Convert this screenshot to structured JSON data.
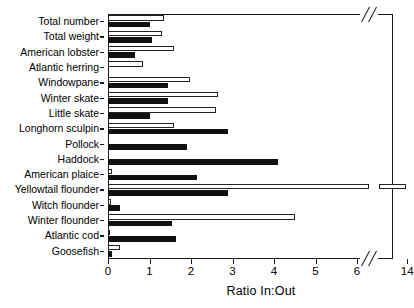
{
  "chart_data": {
    "type": "bar",
    "orientation": "horizontal",
    "title": "",
    "xlabel": "Ratio In:Out",
    "ylabel": "",
    "xlim": [
      0,
      14.6
    ],
    "grid": false,
    "legend": "none",
    "axis_break": {
      "from": 6.3,
      "to": 13.2,
      "note": "x-axis broken between 6 and 14"
    },
    "xticks": [
      0,
      1,
      2,
      3,
      4,
      5,
      6,
      14
    ],
    "xticklabels": [
      "0",
      "1",
      "2",
      "3",
      "4",
      "5",
      "6",
      "14"
    ],
    "categories": [
      "Total number",
      "Total weight",
      "American lobster",
      "Atlantic herring",
      "Windowpane",
      "Winter skate",
      "Little skate",
      "Longhorn sculpin",
      "Pollock",
      "Haddock",
      "American plaice",
      "Yellowtail flounder",
      "Witch flounder",
      "Winter flounder",
      "Atlantic cod",
      "Goosefish"
    ],
    "series": [
      {
        "name": "open-bar",
        "style": "open",
        "values": [
          1.35,
          1.3,
          1.6,
          0.85,
          1.98,
          2.65,
          2.6,
          1.6,
          0,
          0,
          0.1,
          13.8,
          0.08,
          4.5,
          0.06,
          0.3
        ]
      },
      {
        "name": "filled-bar",
        "style": "filled",
        "values": [
          1.0,
          1.05,
          0.65,
          0,
          1.45,
          1.45,
          1.0,
          2.9,
          1.9,
          4.1,
          2.15,
          2.9,
          0.3,
          1.55,
          1.65,
          0.1
        ]
      }
    ]
  },
  "colors": {
    "axis": "#1a1a1a",
    "open_bar_fill": "#ffffff",
    "open_bar_stroke": "#222222",
    "filled_bar": "#111111",
    "background": "#ffffff"
  }
}
